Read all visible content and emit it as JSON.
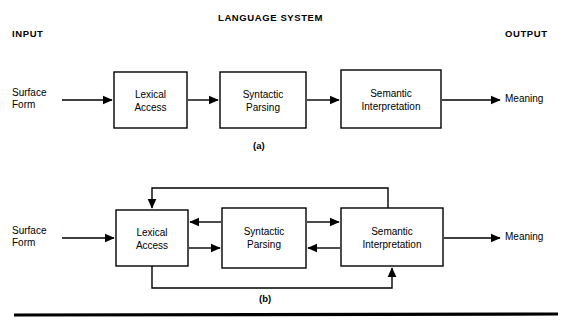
{
  "figure": {
    "headers": {
      "input": "INPUT",
      "system": "LANGUAGE SYSTEM",
      "output": "OUTPUT"
    },
    "captions": {
      "a": "(a)",
      "b": "(b)"
    },
    "io": {
      "surface_line1": "Surface",
      "surface_line2": "Form",
      "meaning": "Meaning"
    },
    "panel_a": {
      "caption": "(a)",
      "stages": [
        {
          "line1": "Lexical",
          "line2": "Access"
        },
        {
          "line1": "Syntactic",
          "line2": "Parsing"
        },
        {
          "line1": "Semantic",
          "line2": "Interpretation"
        }
      ]
    },
    "panel_b": {
      "caption": "(b)",
      "stages": [
        {
          "line1": "Lexical",
          "line2": "Access"
        },
        {
          "line1": "Syntactic",
          "line2": "Parsing"
        },
        {
          "line1": "Semantic",
          "line2": "Interpretation"
        }
      ]
    },
    "colors": {
      "ink": "#000000",
      "background": "#ffffff"
    }
  }
}
